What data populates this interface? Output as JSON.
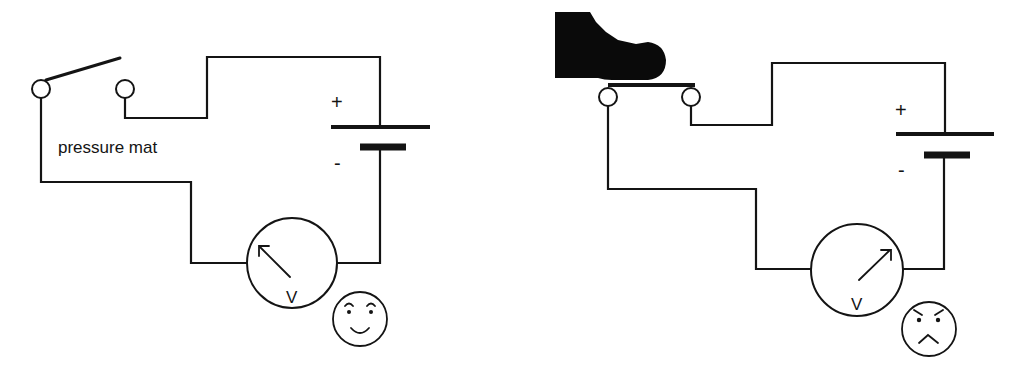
{
  "diagram": {
    "colors": {
      "ink": "#141414",
      "background": "#ffffff",
      "foot": "#0a0a0a"
    },
    "left_circuit": {
      "state": "switch open",
      "switch_label": "pressure mat",
      "battery": {
        "positive_sign": "+",
        "negative_sign": "-"
      },
      "meter": {
        "symbol": "V",
        "needle": "pointing up-left (low reading)"
      },
      "face": {
        "expression": "happy",
        "icon": "smiley-face-icon"
      }
    },
    "right_circuit": {
      "state": "switch closed by foot pressing pressure mat",
      "battery": {
        "positive_sign": "+",
        "negative_sign": "-"
      },
      "meter": {
        "symbol": "V",
        "needle": "pointing up-right (high reading)"
      },
      "face": {
        "expression": "angry",
        "icon": "angry-face-icon"
      }
    }
  }
}
